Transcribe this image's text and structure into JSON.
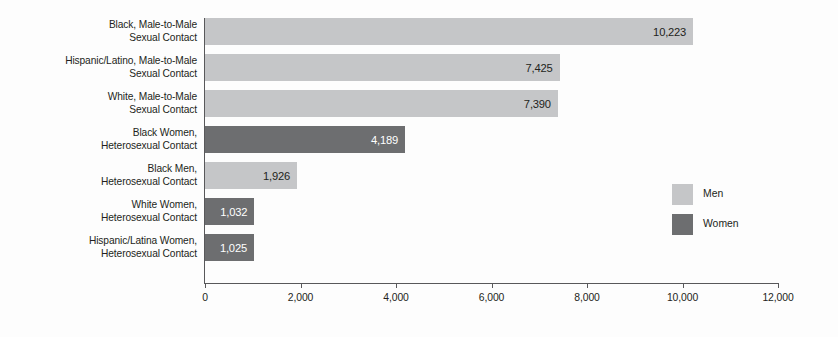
{
  "chart_data": {
    "type": "bar",
    "orientation": "horizontal",
    "title": "",
    "xlabel": "",
    "ylabel": "",
    "xlim": [
      0,
      12000
    ],
    "grid": false,
    "legend_position": "right",
    "xticks": [
      "0",
      "2,000",
      "4,000",
      "6,000",
      "8,000",
      "10,000",
      "12,000"
    ],
    "xtick_values": [
      0,
      2000,
      4000,
      6000,
      8000,
      10000,
      12000
    ],
    "legend": [
      {
        "name": "Men",
        "color": "#c5c6c8"
      },
      {
        "name": "Women",
        "color": "#6d6e70"
      }
    ],
    "categories": [
      "Black, Male-to-Male\nSexual Contact",
      "Hispanic/Latino, Male-to-Male\nSexual Contact",
      "White, Male-to-Male\nSexual Contact",
      "Black Women,\nHeterosexual Contact",
      "Black Men,\nHeterosexual Contact",
      "White Women,\nHeterosexual Contact",
      "Hispanic/Latina Women,\nHeterosexual Contact"
    ],
    "values": [
      10223,
      7425,
      7390,
      4189,
      1926,
      1032,
      1025
    ],
    "value_labels": [
      "10,223",
      "7,425",
      "7,390",
      "4,189",
      "1,926",
      "1,032",
      "1,025"
    ],
    "group": [
      "Men",
      "Men",
      "Men",
      "Women",
      "Men",
      "Women",
      "Women"
    ],
    "bars": [
      {
        "label_line1": "Black, Male-to-Male",
        "label_line2": "Sexual Contact",
        "value": 10223,
        "value_label": "10,223",
        "group": "Men",
        "color": "#c5c6c8"
      },
      {
        "label_line1": "Hispanic/Latino, Male-to-Male",
        "label_line2": "Sexual Contact",
        "value": 7425,
        "value_label": "7,425",
        "group": "Men",
        "color": "#c5c6c8"
      },
      {
        "label_line1": "White, Male-to-Male",
        "label_line2": "Sexual Contact",
        "value": 7390,
        "value_label": "7,390",
        "group": "Men",
        "color": "#c5c6c8"
      },
      {
        "label_line1": "Black Women,",
        "label_line2": "Heterosexual Contact",
        "value": 4189,
        "value_label": "4,189",
        "group": "Women",
        "color": "#6d6e70"
      },
      {
        "label_line1": "Black Men,",
        "label_line2": "Heterosexual Contact",
        "value": 1926,
        "value_label": "1,926",
        "group": "Men",
        "color": "#c5c6c8"
      },
      {
        "label_line1": "White Women,",
        "label_line2": "Heterosexual Contact",
        "value": 1032,
        "value_label": "1,032",
        "group": "Women",
        "color": "#6d6e70"
      },
      {
        "label_line1": "Hispanic/Latina Women,",
        "label_line2": "Heterosexual Contact",
        "value": 1025,
        "value_label": "1,025",
        "group": "Women",
        "color": "#6d6e70"
      }
    ]
  },
  "colors": {
    "men": "#c5c6c8",
    "women": "#6d6e70",
    "axis": "#58585a",
    "text": "#231f20",
    "background": "#fdfdfd"
  }
}
